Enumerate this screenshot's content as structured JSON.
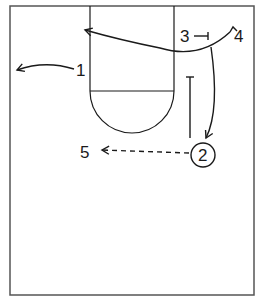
{
  "diagram": {
    "type": "basketball-play-half-court",
    "colors": {
      "line": "#1a1a1a",
      "border": "#555555",
      "background": "#ffffff"
    },
    "players": [
      {
        "id": "1",
        "label": "1"
      },
      {
        "id": "2",
        "label": "2",
        "has_ball": true
      },
      {
        "id": "3",
        "label": "3"
      },
      {
        "id": "4",
        "label": "4"
      },
      {
        "id": "5",
        "label": "5"
      }
    ],
    "actions": [
      {
        "player": "1",
        "type": "cut",
        "direction": "to left wing"
      },
      {
        "player": "4",
        "type": "cut",
        "direction": "baseline-to-opposite-side along top of lane"
      },
      {
        "player": "3",
        "type": "screen"
      },
      {
        "player": "4",
        "type": "cut",
        "direction": "down to 2's spot"
      },
      {
        "player": "2",
        "type": "screen",
        "direction": "up the lane"
      },
      {
        "player": "2",
        "type": "pass",
        "to": "5"
      }
    ]
  }
}
